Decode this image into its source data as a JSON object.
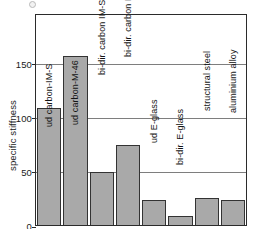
{
  "chart_data": {
    "type": "bar",
    "title": "",
    "xlabel": "",
    "ylabel": "specific stiffness",
    "ylim": [
      0,
      196
    ],
    "yticks": [
      0,
      50,
      100,
      150
    ],
    "ytick_labels": [
      "0",
      "50",
      "100",
      "150"
    ],
    "grid": true,
    "legend": "none",
    "categories": [
      "ud carbon-IM-S",
      "ud carbon-M-46",
      "bi-dir. carbon  IM-S",
      "bi-dir. carbon M46",
      "ud E-glass",
      "bi-dir. E-glass",
      "structural steel",
      "aluminium alloy"
    ],
    "values": [
      108,
      156,
      49,
      74,
      23,
      8,
      25,
      23
    ],
    "bar_color": "#a9a9a9",
    "bar_edge_color": "#333333",
    "axis_color": "#2b2b2b",
    "gridline_color": "#7e7e7e",
    "label_placement": "rotated-vertical-inside-bar"
  }
}
